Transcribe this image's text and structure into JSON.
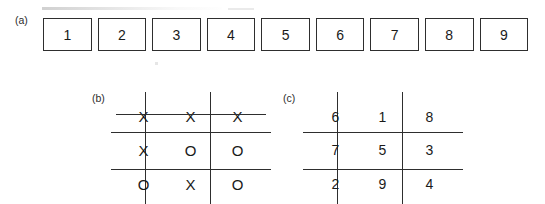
{
  "figure": {
    "panels": [
      {
        "id": "a",
        "label": "(a)",
        "kind": "numbered-box-row",
        "boxes": [
          "1",
          "2",
          "3",
          "4",
          "5",
          "6",
          "7",
          "8",
          "9"
        ]
      },
      {
        "id": "b",
        "label": "(b)",
        "kind": "tic-tac-toe-board",
        "rows": [
          [
            "X",
            "X",
            "X"
          ],
          [
            "X",
            "O",
            "O"
          ],
          [
            "O",
            "X",
            "O"
          ]
        ],
        "winning_line": "top-row",
        "has_strike_through": "true"
      },
      {
        "id": "c",
        "label": "(c)",
        "kind": "magic-square",
        "rows": [
          [
            "6",
            "1",
            "8"
          ],
          [
            "7",
            "5",
            "3"
          ],
          [
            "2",
            "9",
            "4"
          ]
        ]
      }
    ]
  },
  "colors": {
    "ink": "#2e2e2e",
    "text": "#1a1a1a",
    "background": "#ffffff"
  }
}
